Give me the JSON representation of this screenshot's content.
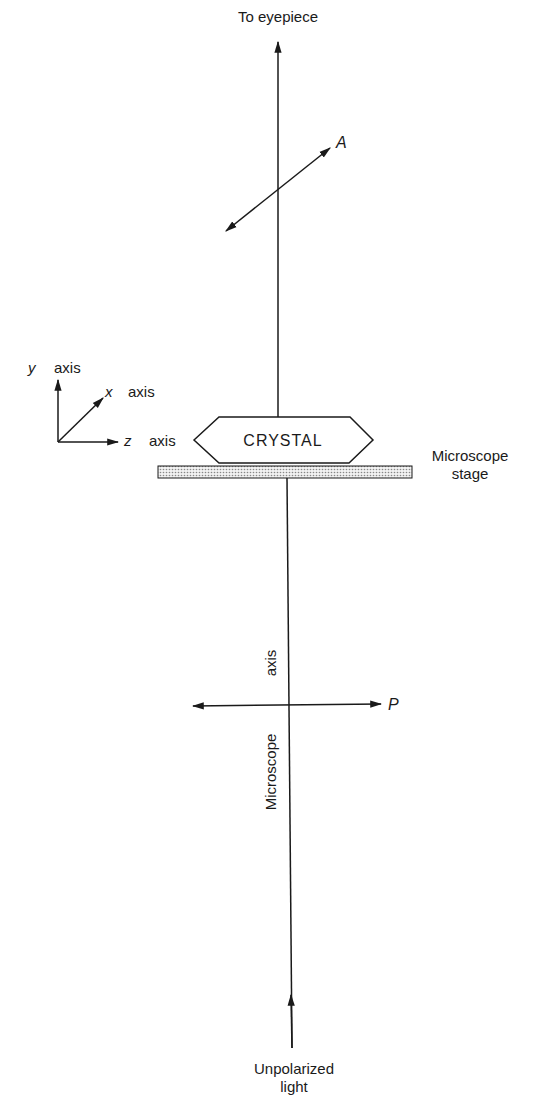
{
  "diagram": {
    "labels": {
      "eyepiece": "To eyepiece",
      "analyzer": "A",
      "polarizer": "P",
      "crystal": "CRYSTAL",
      "stage_line1": "Microscope",
      "stage_line2": "stage",
      "microscope_axis_word1": "Microscope",
      "microscope_axis_word2": "axis",
      "light_line1": "Unpolarized",
      "light_line2": "light"
    },
    "axes": {
      "y_letter": "y",
      "y_word": "axis",
      "x_letter": "x",
      "x_word": "axis",
      "z_letter": "z",
      "z_word": "axis"
    },
    "colors": {
      "ink": "#1a1a1a",
      "stage_fill": "#d9d9d9"
    }
  }
}
